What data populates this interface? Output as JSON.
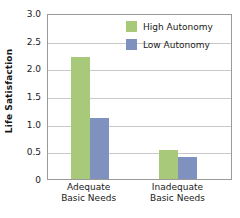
{
  "chart_data": {
    "type": "bar",
    "title": "",
    "xlabel": "",
    "ylabel": "Life Satisfaction",
    "categories": [
      "Adequate Basic Needs",
      "Inadequate Basic Needs"
    ],
    "category_lines": [
      [
        "Adequate",
        "Basic Needs"
      ],
      [
        "Inadequate",
        "Basic Needs"
      ]
    ],
    "series": [
      {
        "name": "High Autonomy",
        "color": "#a8c97a",
        "values": [
          2.2,
          0.52
        ]
      },
      {
        "name": "Low Autonomy",
        "color": "#7f91bf",
        "values": [
          1.1,
          0.4
        ]
      }
    ],
    "ylim": [
      0,
      3.0
    ],
    "ytick_values": [
      0,
      0.5,
      1.0,
      1.5,
      2.0,
      2.5,
      3.0
    ],
    "ytick_labels": [
      "0",
      "0.5",
      "1.0",
      "1.5",
      "2.0",
      "2.5",
      "3.0"
    ],
    "grid": "horizontal",
    "legend_position": "top-right-inside"
  },
  "axes": {
    "y_title": "Life Satisfaction"
  },
  "legend": {
    "items": [
      {
        "label": "High Autonomy",
        "color": "#a8c97a"
      },
      {
        "label": "Low Autonomy",
        "color": "#7f91bf"
      }
    ]
  },
  "colors": {
    "high_autonomy": "#a8c97a",
    "low_autonomy": "#7f91bf",
    "gridline": "#c9c9c9",
    "frame": "#9a9a9a",
    "text": "#1a1a1a",
    "background": "#ffffff"
  }
}
